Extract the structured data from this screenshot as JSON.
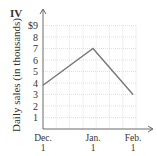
{
  "panel_label": "IV",
  "chart_data": {
    "type": "line",
    "title": "",
    "xlabel": "",
    "ylabel": "Daily sales (in thousands)",
    "categories": [
      "Dec. 1",
      "Jan. 1",
      "Feb. 1"
    ],
    "x_tick_lines": [
      [
        "Dec.",
        "1"
      ],
      [
        "Jan.",
        "1"
      ],
      [
        "Feb.",
        "1"
      ]
    ],
    "y_ticks": [
      "1",
      "2",
      "3",
      "4",
      "5",
      "6",
      "7",
      "8",
      "$9"
    ],
    "ylim": [
      0,
      9
    ],
    "grid": true,
    "series": [
      {
        "name": "Daily sales",
        "color": "#777777",
        "values": [
          3.8,
          7,
          3
        ]
      }
    ]
  }
}
